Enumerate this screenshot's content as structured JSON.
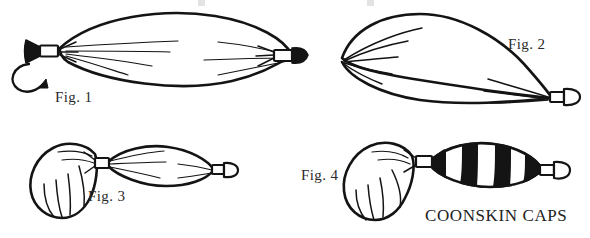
{
  "document": {
    "title": "Coonskin Caps balloon twisting instructions",
    "background_color": "#ffffff",
    "ink_color": "#141414",
    "style": "black and white line drawing"
  },
  "figures": [
    {
      "id": "fig1",
      "label": "Fig. 1",
      "description": "Long inflated balloon tied at both ends, curved arrow at lower-left indicating a twist",
      "has_arrow": true,
      "arrow_name": "twist-direction-arrow"
    },
    {
      "id": "fig2",
      "label": "Fig. 2",
      "description": "Balloon folded into a teardrop loop with gathered pleats at the left and tied nozzle at the lower right"
    },
    {
      "id": "fig3",
      "label": "Fig. 3",
      "description": "Balloon pinched into two lobes: a rounded fringed tail lobe on the left and an oval body on the right"
    },
    {
      "id": "fig4",
      "label": "Fig. 4",
      "description": "Finished coonskin cap: rounded fringed lobe joined to a striped banded body with a tied tip"
    }
  ],
  "caption": {
    "text": "COONSKIN CAPS"
  },
  "stripes": {
    "count": 4,
    "color": "#141414"
  }
}
